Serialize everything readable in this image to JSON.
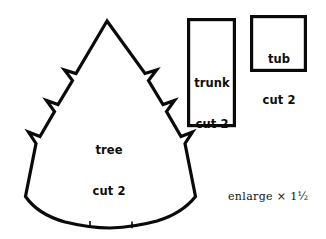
{
  "sheet": {
    "title": "Tree / trunk / tub sewing pattern sheet",
    "background_color": "#ffffff",
    "ink_color": "#0a0a0a",
    "width": 326,
    "height": 239
  },
  "pieces": [
    {
      "id": "tree",
      "shape": "zigzag-edged christmas tree with curved hem",
      "label_line1": "tree",
      "label_line2": "cut 2",
      "notch_ticks": 2
    },
    {
      "id": "trunk",
      "shape": "tall rectangle",
      "label_line1": "trunk",
      "label_line2": "cut 2",
      "notch_ticks": 0
    },
    {
      "id": "tub",
      "shape": "square",
      "label_line1": "tub",
      "label_line2": "cut 2",
      "notch_ticks": 0
    }
  ],
  "note": {
    "text": "enlarge × 1½"
  }
}
